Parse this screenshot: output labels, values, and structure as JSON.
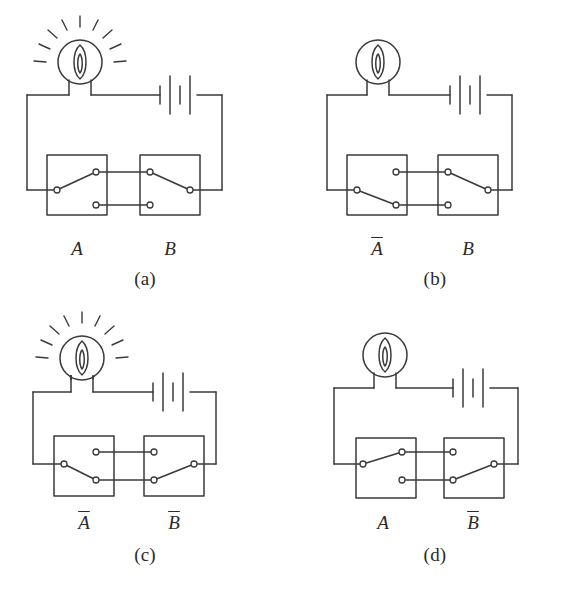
{
  "figure": {
    "panel_count": 4
  },
  "panels": [
    {
      "id": "a",
      "caption": "(a)",
      "lamp_state": "lit",
      "left_switch": {
        "label": "A",
        "negated": false,
        "position": "up"
      },
      "right_switch": {
        "label": "B",
        "negated": false,
        "position": "down"
      },
      "circuit_closed": true
    },
    {
      "id": "b",
      "caption": "(b)",
      "lamp_state": "unlit",
      "left_switch": {
        "label": "A",
        "negated": true,
        "position": "down"
      },
      "right_switch": {
        "label": "B",
        "negated": false,
        "position": "down"
      },
      "circuit_closed": false
    },
    {
      "id": "c",
      "caption": "(c)",
      "lamp_state": "lit",
      "left_switch": {
        "label": "A",
        "negated": true,
        "position": "down"
      },
      "right_switch": {
        "label": "B",
        "negated": true,
        "position": "up"
      },
      "circuit_closed": true
    },
    {
      "id": "d",
      "caption": "(d)",
      "lamp_state": "unlit",
      "left_switch": {
        "label": "A",
        "negated": false,
        "position": "up"
      },
      "right_switch": {
        "label": "B",
        "negated": true,
        "position": "up"
      },
      "circuit_closed": false
    }
  ],
  "symbols": {
    "lamp": "lamp-icon",
    "lamp_lit": "lamp-lit-icon",
    "lamp_unlit": "lamp-unlit-icon",
    "battery": "battery-icon",
    "switch": "relay-switch-icon",
    "terminal": "terminal-node-icon",
    "wire": "wire-line"
  },
  "colors": {
    "ink": "#2b2b2b",
    "line": "#3a3a3a",
    "background": "#ffffff",
    "node_fill": "#ffffff"
  }
}
